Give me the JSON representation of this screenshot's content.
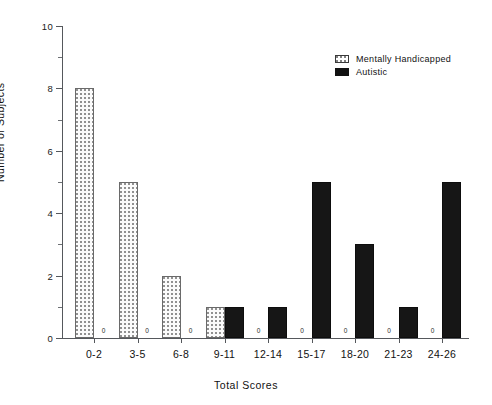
{
  "chart_data": {
    "type": "bar",
    "title": "",
    "xlabel": "Total Scores",
    "ylabel": "Number of Subjects",
    "categories": [
      "0-2",
      "3-5",
      "6-8",
      "9-11",
      "12-14",
      "15-17",
      "18-20",
      "21-23",
      "24-26"
    ],
    "series": [
      {
        "name": "Mentally Handicapped",
        "fill": "dotted",
        "color": "#fbfbfb",
        "values": [
          8,
          5,
          2,
          1,
          0,
          0,
          0,
          0,
          0
        ]
      },
      {
        "name": "Autistic",
        "fill": "solid",
        "color": "#161616",
        "values": [
          0,
          0,
          0,
          1,
          1,
          5,
          3,
          1,
          5
        ]
      }
    ],
    "ylim": [
      0,
      10
    ],
    "ytick_labels": [
      "0",
      "2",
      "4",
      "6",
      "8",
      "10"
    ],
    "ytick_values": [
      0,
      2,
      4,
      6,
      8,
      10
    ],
    "yminor_values": [
      1,
      3,
      5,
      7,
      9
    ],
    "zero_annotation": "0",
    "grid": false,
    "legend_position": "top-right"
  },
  "legend": {
    "entries": [
      {
        "label": "Mentally Handicapped"
      },
      {
        "label": "Autistic"
      }
    ]
  }
}
